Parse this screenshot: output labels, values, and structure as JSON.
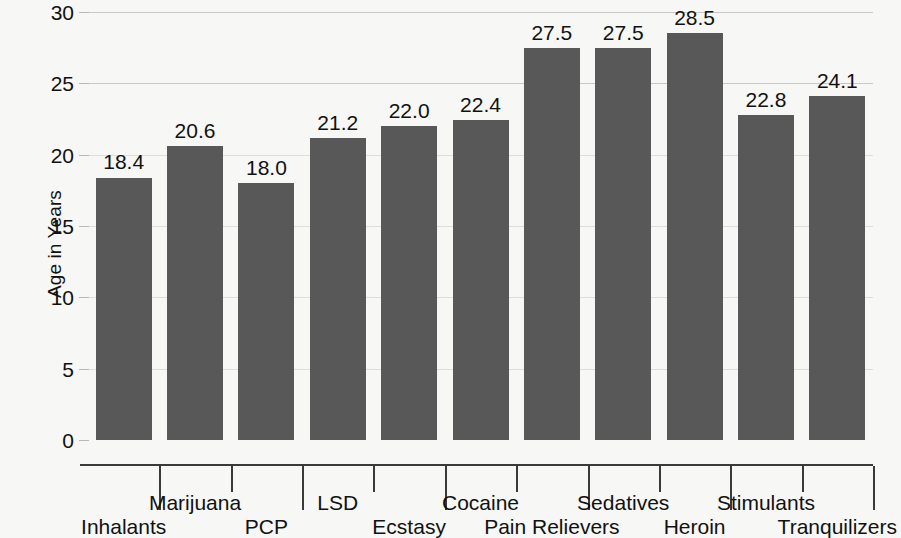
{
  "chart_data": {
    "type": "bar",
    "title": "",
    "subtitle": "",
    "xlabel": "",
    "ylabel": "Age in Years",
    "ylim": [
      0,
      30
    ],
    "ytick_values": [
      0,
      5,
      10,
      15,
      20,
      25,
      30
    ],
    "ytick_labels": [
      "0",
      "5",
      "10",
      "15",
      "20",
      "25",
      "30"
    ],
    "grid": "horizontal",
    "legend": "none",
    "orientation": "vertical",
    "bar_color": "#585858",
    "background_color": "#f7f7f5",
    "categories": [
      "Inhalants",
      "Marijuana",
      "PCP",
      "LSD",
      "Ecstasy",
      "Cocaine",
      "Pain Relievers",
      "Sedatives",
      "Heroin",
      "Stimulants",
      "Tranquilizers"
    ],
    "values": [
      18.4,
      20.6,
      18.0,
      21.2,
      22.0,
      22.4,
      27.5,
      27.5,
      28.5,
      22.8,
      24.1
    ],
    "data_labels": [
      "18.4",
      "20.6",
      "18.0",
      "21.2",
      "22.0",
      "22.4",
      "27.5",
      "27.5",
      "28.5",
      "22.8",
      "24.1"
    ],
    "category_label_rows": [
      "bottom",
      "top",
      "bottom",
      "top",
      "bottom",
      "top",
      "bottom",
      "top",
      "bottom",
      "top",
      "bottom"
    ]
  }
}
